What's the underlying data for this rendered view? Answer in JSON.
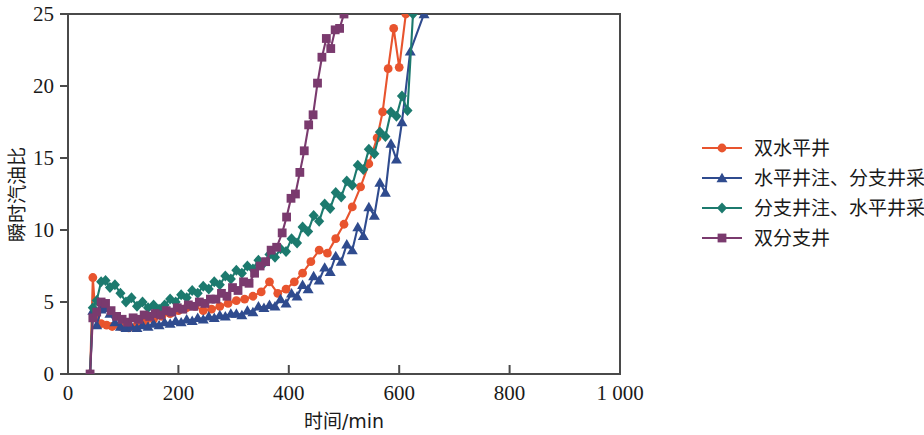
{
  "chart_data": {
    "type": "line",
    "title": "",
    "xlabel": "时间/min",
    "ylabel": "瞬时汽油比",
    "xlim": [
      0,
      1000
    ],
    "ylim": [
      0,
      25
    ],
    "xticks": [
      "0",
      "200",
      "400",
      "600",
      "800",
      "1 000"
    ],
    "xtick_values": [
      0,
      200,
      400,
      600,
      800,
      1000
    ],
    "yticks": [
      "0",
      "5",
      "10",
      "15",
      "20",
      "25"
    ],
    "ytick_values": [
      0,
      5,
      10,
      15,
      20,
      25
    ],
    "grid": false,
    "legend_position": "right",
    "series": [
      {
        "name": "双水平井",
        "color": "#E8542E",
        "marker": "circle",
        "points": [
          [
            40,
            0.0
          ],
          [
            45,
            6.7
          ],
          [
            50,
            3.9
          ],
          [
            60,
            3.5
          ],
          [
            70,
            3.4
          ],
          [
            80,
            3.3
          ],
          [
            95,
            3.3
          ],
          [
            110,
            3.2
          ],
          [
            125,
            3.4
          ],
          [
            140,
            3.6
          ],
          [
            155,
            3.8
          ],
          [
            170,
            4.0
          ],
          [
            185,
            4.2
          ],
          [
            200,
            4.4
          ],
          [
            215,
            4.6
          ],
          [
            230,
            4.7
          ],
          [
            245,
            4.4
          ],
          [
            260,
            4.5
          ],
          [
            275,
            4.7
          ],
          [
            290,
            4.9
          ],
          [
            305,
            5.1
          ],
          [
            320,
            5.2
          ],
          [
            335,
            5.4
          ],
          [
            350,
            5.7
          ],
          [
            365,
            6.4
          ],
          [
            380,
            5.6
          ],
          [
            395,
            5.9
          ],
          [
            410,
            6.4
          ],
          [
            425,
            7.0
          ],
          [
            440,
            7.8
          ],
          [
            455,
            8.6
          ],
          [
            470,
            8.4
          ],
          [
            485,
            9.4
          ],
          [
            500,
            10.4
          ],
          [
            515,
            11.6
          ],
          [
            530,
            13.0
          ],
          [
            545,
            14.6
          ],
          [
            560,
            16.4
          ],
          [
            570,
            18.2
          ],
          [
            580,
            21.2
          ],
          [
            590,
            24.0
          ],
          [
            600,
            21.3
          ],
          [
            612,
            25.0
          ]
        ]
      },
      {
        "name": "水平井注、分支井采",
        "color": "#2F4B8E",
        "marker": "triangle",
        "points": [
          [
            40,
            0.0
          ],
          [
            45,
            4.4
          ],
          [
            52,
            3.4
          ],
          [
            60,
            4.5
          ],
          [
            68,
            4.6
          ],
          [
            76,
            4.2
          ],
          [
            85,
            3.6
          ],
          [
            95,
            3.3
          ],
          [
            105,
            3.2
          ],
          [
            115,
            3.3
          ],
          [
            125,
            3.2
          ],
          [
            135,
            3.4
          ],
          [
            145,
            3.3
          ],
          [
            155,
            3.5
          ],
          [
            165,
            3.4
          ],
          [
            175,
            3.6
          ],
          [
            185,
            3.5
          ],
          [
            195,
            3.7
          ],
          [
            205,
            3.6
          ],
          [
            215,
            3.8
          ],
          [
            225,
            3.7
          ],
          [
            235,
            3.9
          ],
          [
            245,
            3.8
          ],
          [
            255,
            4.0
          ],
          [
            265,
            3.9
          ],
          [
            275,
            4.1
          ],
          [
            285,
            4.0
          ],
          [
            295,
            4.2
          ],
          [
            305,
            4.2
          ],
          [
            315,
            4.1
          ],
          [
            325,
            4.4
          ],
          [
            335,
            4.3
          ],
          [
            345,
            4.7
          ],
          [
            355,
            4.6
          ],
          [
            365,
            4.8
          ],
          [
            375,
            4.7
          ],
          [
            385,
            5.2
          ],
          [
            395,
            4.9
          ],
          [
            405,
            5.6
          ],
          [
            415,
            5.4
          ],
          [
            425,
            6.2
          ],
          [
            435,
            5.9
          ],
          [
            445,
            6.8
          ],
          [
            455,
            6.5
          ],
          [
            465,
            7.4
          ],
          [
            475,
            7.1
          ],
          [
            485,
            8.2
          ],
          [
            495,
            7.8
          ],
          [
            505,
            9.0
          ],
          [
            515,
            8.6
          ],
          [
            525,
            10.2
          ],
          [
            535,
            9.6
          ],
          [
            545,
            11.6
          ],
          [
            555,
            11.0
          ],
          [
            565,
            13.3
          ],
          [
            575,
            12.6
          ],
          [
            585,
            16.0
          ],
          [
            595,
            14.9
          ],
          [
            605,
            17.5
          ],
          [
            620,
            22.4
          ],
          [
            645,
            25.0
          ]
        ]
      },
      {
        "name": "分支井注、水平井采",
        "color": "#1C7A6E",
        "marker": "diamond",
        "points": [
          [
            40,
            0.0
          ],
          [
            45,
            4.6
          ],
          [
            52,
            5.1
          ],
          [
            60,
            6.4
          ],
          [
            68,
            6.5
          ],
          [
            76,
            6.0
          ],
          [
            85,
            6.2
          ],
          [
            95,
            5.6
          ],
          [
            105,
            5.0
          ],
          [
            115,
            5.3
          ],
          [
            125,
            4.7
          ],
          [
            135,
            5.0
          ],
          [
            145,
            4.6
          ],
          [
            155,
            4.8
          ],
          [
            165,
            4.5
          ],
          [
            175,
            4.8
          ],
          [
            185,
            5.2
          ],
          [
            195,
            5.0
          ],
          [
            205,
            5.5
          ],
          [
            215,
            5.3
          ],
          [
            225,
            5.8
          ],
          [
            235,
            5.6
          ],
          [
            245,
            6.1
          ],
          [
            255,
            5.9
          ],
          [
            265,
            6.4
          ],
          [
            275,
            6.2
          ],
          [
            285,
            6.8
          ],
          [
            295,
            6.6
          ],
          [
            305,
            7.2
          ],
          [
            315,
            7.0
          ],
          [
            325,
            7.5
          ],
          [
            335,
            7.3
          ],
          [
            345,
            7.9
          ],
          [
            355,
            7.7
          ],
          [
            365,
            8.3
          ],
          [
            375,
            8.1
          ],
          [
            385,
            8.7
          ],
          [
            395,
            8.5
          ],
          [
            405,
            9.4
          ],
          [
            415,
            9.1
          ],
          [
            425,
            10.2
          ],
          [
            435,
            9.9
          ],
          [
            445,
            11.0
          ],
          [
            455,
            10.6
          ],
          [
            465,
            11.8
          ],
          [
            475,
            11.5
          ],
          [
            485,
            12.6
          ],
          [
            495,
            12.3
          ],
          [
            505,
            13.4
          ],
          [
            515,
            13.1
          ],
          [
            525,
            14.5
          ],
          [
            535,
            14.2
          ],
          [
            545,
            15.6
          ],
          [
            555,
            15.3
          ],
          [
            565,
            16.8
          ],
          [
            575,
            16.5
          ],
          [
            585,
            18.2
          ],
          [
            595,
            17.9
          ],
          [
            605,
            19.3
          ],
          [
            615,
            18.3
          ],
          [
            625,
            25.0
          ]
        ]
      },
      {
        "name": "双分支井",
        "color": "#7A3A6E",
        "marker": "square",
        "points": [
          [
            40,
            0.0
          ],
          [
            45,
            3.9
          ],
          [
            52,
            4.3
          ],
          [
            60,
            5.0
          ],
          [
            68,
            4.9
          ],
          [
            78,
            4.4
          ],
          [
            88,
            4.0
          ],
          [
            98,
            3.8
          ],
          [
            108,
            3.6
          ],
          [
            118,
            3.9
          ],
          [
            128,
            3.8
          ],
          [
            138,
            4.1
          ],
          [
            148,
            4.0
          ],
          [
            158,
            4.2
          ],
          [
            168,
            4.1
          ],
          [
            178,
            4.4
          ],
          [
            188,
            4.3
          ],
          [
            198,
            4.6
          ],
          [
            208,
            4.5
          ],
          [
            218,
            4.8
          ],
          [
            228,
            4.7
          ],
          [
            238,
            5.0
          ],
          [
            248,
            4.9
          ],
          [
            258,
            5.2
          ],
          [
            268,
            5.2
          ],
          [
            278,
            5.6
          ],
          [
            288,
            5.4
          ],
          [
            298,
            6.0
          ],
          [
            308,
            5.8
          ],
          [
            318,
            6.4
          ],
          [
            328,
            6.3
          ],
          [
            338,
            7.0
          ],
          [
            348,
            7.5
          ],
          [
            358,
            7.8
          ],
          [
            368,
            8.6
          ],
          [
            378,
            8.8
          ],
          [
            388,
            9.8
          ],
          [
            396,
            10.9
          ],
          [
            404,
            12.2
          ],
          [
            412,
            12.5
          ],
          [
            420,
            14.0
          ],
          [
            428,
            15.5
          ],
          [
            436,
            17.3
          ],
          [
            444,
            18.0
          ],
          [
            452,
            20.2
          ],
          [
            460,
            22.0
          ],
          [
            468,
            23.3
          ],
          [
            476,
            22.6
          ],
          [
            484,
            23.9
          ],
          [
            492,
            24.0
          ],
          [
            500,
            25.0
          ]
        ]
      }
    ]
  },
  "legend": {
    "items": [
      {
        "label": "双水平井",
        "color": "#E8542E",
        "marker": "circle"
      },
      {
        "label": "水平井注、分支井采",
        "color": "#2F4B8E",
        "marker": "triangle"
      },
      {
        "label": "分支井注、水平井采",
        "color": "#1C7A6E",
        "marker": "diamond"
      },
      {
        "label": "双分支井",
        "color": "#7A3A6E",
        "marker": "square"
      }
    ]
  }
}
